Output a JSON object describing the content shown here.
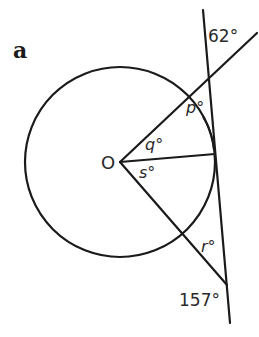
{
  "figure": {
    "part_label": "a",
    "center_label": "O",
    "angles": {
      "top_given": "62°",
      "bottom_given": "157°",
      "p": "p°",
      "q": "q°",
      "s": "s°",
      "r": "r°"
    },
    "elements": [
      "circle with centre O",
      "tangent line touching circle at right",
      "line from O through circle meeting tangent above (angle 62° at intersection)",
      "radius from O to point of tangency",
      "line from O through circle meeting tangent below (angle 157° at intersection)"
    ],
    "colors": {
      "stroke": "#1a1a1a",
      "text": "#2a2a2a",
      "background": "#ffffff"
    }
  }
}
